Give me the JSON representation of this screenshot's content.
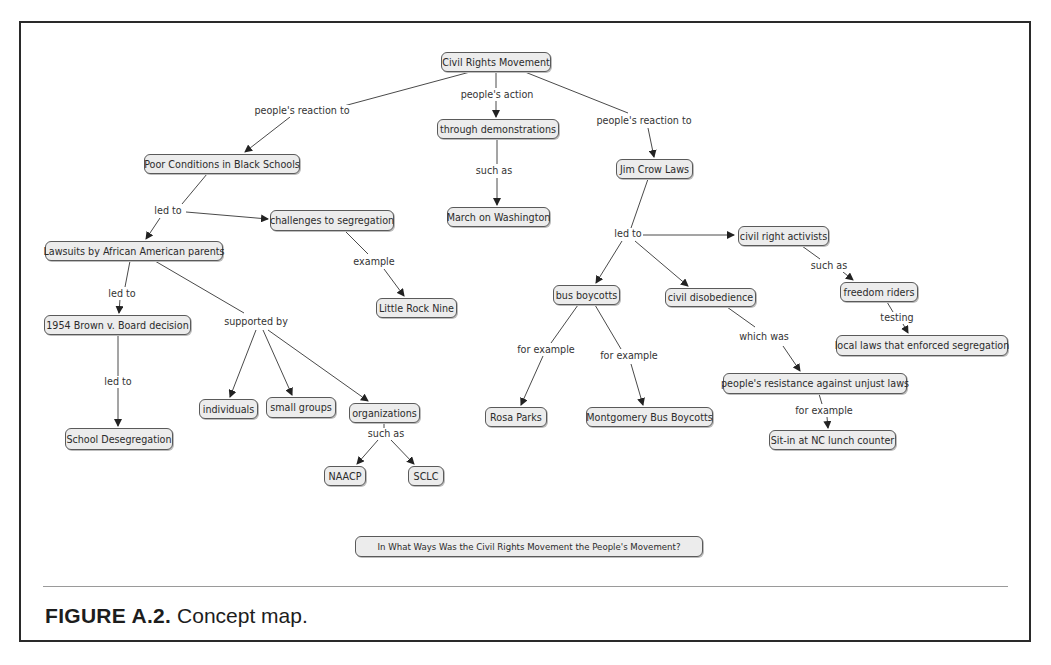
{
  "figure": {
    "label": "FIGURE A.2.",
    "caption": "Concept map."
  },
  "question": "In What Ways Was the Civil Rights Movement the People's Movement?",
  "nodes": {
    "root": "Civil Rights Movement",
    "demonstrations": "through demonstrations",
    "march": "March on Washington",
    "jimcrow": "Jim Crow Laws",
    "poor": "Poor Conditions in Black Schools",
    "challenges": "challenges to segregation",
    "lawsuits": "Lawsuits by African American parents",
    "littlerock": "Little Rock Nine",
    "brown": "1954 Brown v. Board decision",
    "desegregation": "School Desegregation",
    "individuals": "individuals",
    "smallgroups": "small groups",
    "organizations": "organizations",
    "naacp": "NAACP",
    "sclc": "SCLC",
    "busboycotts": "bus boycotts",
    "disobedience": "civil disobedience",
    "rosaparks": "Rosa Parks",
    "montgomery": "Montgomery Bus Boycotts",
    "activists": "civil right activists",
    "freedomriders": "freedom riders",
    "locallaws": "local laws that enforced segregation",
    "resistance": "people's resistance against unjust laws",
    "sitin": "Sit-in at NC lunch counter"
  },
  "links": {
    "reaction_left": "people's reaction to",
    "action": "people's action",
    "reaction_right": "people's reaction to",
    "suchas_march": "such as",
    "ledto_poor": "led to",
    "example_lrn": "example",
    "ledto_lawsuits": "led to",
    "supportedby": "supported by",
    "ledto_brown": "led to",
    "suchas_org": "such as",
    "ledto_jimcrow": "led to",
    "forexample_rosa": "for example",
    "forexample_mont": "for example",
    "whichwas": "which was",
    "suchas_activists": "such as",
    "testing": "testing",
    "forexample_sitin": "for example"
  },
  "colors": {
    "node_fill": "#ececec",
    "node_border": "#5a5a5a",
    "line": "#444444",
    "frame": "#2a2a2a"
  }
}
